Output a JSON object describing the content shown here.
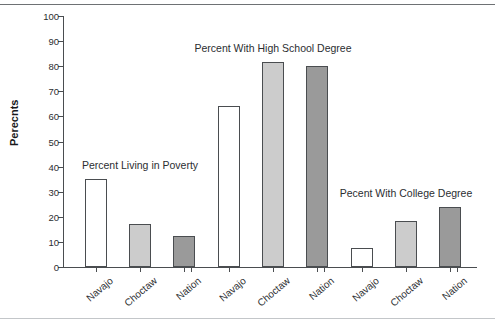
{
  "chart_data": {
    "type": "bar",
    "title": "",
    "xlabel": "",
    "ylabel": "Perecnts",
    "ylim": [
      0,
      100
    ],
    "ytick_step": 10,
    "yticks": [
      0,
      10,
      20,
      30,
      40,
      50,
      60,
      70,
      80,
      90,
      100
    ],
    "grid": false,
    "legend_position": "none",
    "categories": [
      "Navajo",
      "Choctaw",
      "Nation"
    ],
    "groups": [
      {
        "label": "Percent Living in Poverty",
        "categories": [
          "Navajo",
          "Choctaw",
          "Nation"
        ],
        "values": [
          35,
          17,
          12.5
        ]
      },
      {
        "label": "Percent With High School Degree",
        "categories": [
          "Navajo",
          "Choctaw",
          "Nation"
        ],
        "values": [
          64,
          81.5,
          80
        ]
      },
      {
        "label": "Pecent With College Degree",
        "categories": [
          "Navajo",
          "Choctaw",
          "Nation"
        ],
        "values": [
          7.5,
          18.5,
          24
        ]
      }
    ],
    "series": [
      {
        "name": "Navajo",
        "values": [
          35,
          64,
          7.5
        ]
      },
      {
        "name": "Choctaw",
        "values": [
          17,
          81.5,
          18.5
        ]
      },
      {
        "name": "Nation",
        "values": [
          12.5,
          80,
          24
        ]
      }
    ],
    "bar_fills": {
      "Navajo": "#ffffff",
      "Choctaw": "#cccccc",
      "Nation": "#9a9a9a"
    },
    "bar_outline": "#4a4d50",
    "axis_color": "#4a4d50",
    "background": "#ffffff"
  }
}
